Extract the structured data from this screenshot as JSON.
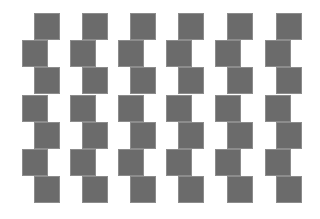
{
  "figure": {
    "square_color": "#6b6b6b",
    "border_color": "#8c8c8c",
    "background": "#ffffff",
    "square_width": 24,
    "square_height": 25,
    "rows": [
      {
        "y": 14,
        "xs": [
          35,
          83,
          131,
          179,
          228,
          277
        ]
      },
      {
        "y": 41,
        "xs": [
          23,
          71,
          119,
          167,
          216,
          266
        ]
      },
      {
        "y": 68,
        "xs": [
          35,
          83,
          131,
          179,
          228,
          277
        ]
      },
      {
        "y": 96,
        "xs": [
          23,
          71,
          119,
          167,
          216,
          266
        ]
      },
      {
        "y": 123,
        "xs": [
          35,
          83,
          131,
          179,
          228,
          277
        ]
      },
      {
        "y": 150,
        "xs": [
          23,
          71,
          119,
          167,
          216,
          266
        ]
      },
      {
        "y": 177,
        "xs": [
          35,
          83,
          131,
          179,
          228,
          277
        ]
      }
    ]
  }
}
